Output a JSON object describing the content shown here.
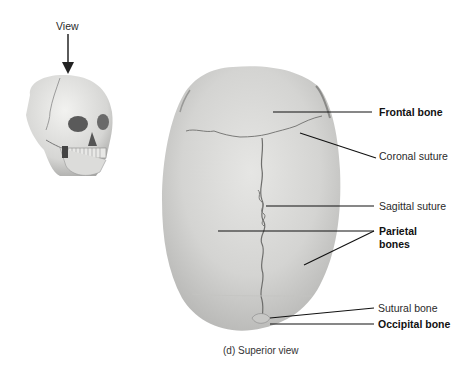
{
  "figure": {
    "caption": "(d) Superior view",
    "view_indicator": {
      "label": "View",
      "icon": "arrow-down-icon"
    },
    "thumbnail": {
      "subject": "skull-three-quarter-view-icon"
    },
    "main_image": {
      "subject": "skull-superior-view"
    },
    "labels": [
      {
        "id": "frontal-bone",
        "text": "Frontal bone",
        "bold": true
      },
      {
        "id": "coronal-suture",
        "text": "Coronal suture",
        "bold": false
      },
      {
        "id": "sagittal-suture",
        "text": "Sagittal suture",
        "bold": false
      },
      {
        "id": "parietal-bones",
        "text": "Parietal\nbones",
        "line1": "Parietal",
        "line2": "bones",
        "bold": true
      },
      {
        "id": "sutural-bone",
        "text": "Sutural bone",
        "bold": false
      },
      {
        "id": "occipital-bone",
        "text": "Occipital bone",
        "bold": true
      }
    ],
    "colors": {
      "bone": "#d8d8d6",
      "bone_shadow": "#b8b8b6",
      "suture": "#6e6e6e",
      "leader_line": "#111111"
    }
  }
}
